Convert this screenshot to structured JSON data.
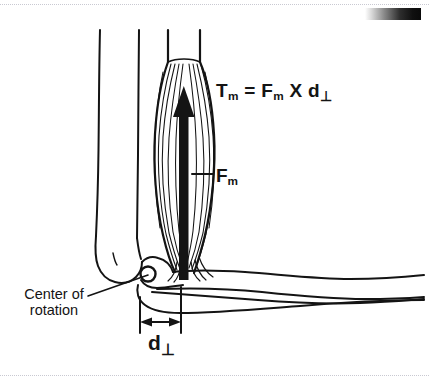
{
  "page": {
    "background_color": "#ffffff",
    "ink_color": "#141414",
    "width": 429,
    "height": 386
  },
  "decorations": {
    "top_rule": "dotted-separator",
    "bottom_rule": "dotted-separator",
    "gradient_bar": {
      "name": "grayscale-gradient-bar",
      "from_color": "#ffffff",
      "to_color": "#0a0a0a"
    }
  },
  "labels": {
    "equation": {
      "full_text": "Tm = Fm X d⊥",
      "torque_symbol": "T",
      "torque_subscript": "m",
      "equals": "=",
      "force_symbol": "F",
      "force_subscript": "m",
      "times": "X",
      "distance_symbol": "d",
      "distance_subscript": "⊥"
    },
    "force": {
      "symbol": "F",
      "subscript": "m"
    },
    "moment_arm": {
      "symbol": "d",
      "subscript": "⊥"
    },
    "center_of_rotation": {
      "line1": "Center of",
      "line2": "rotation"
    }
  },
  "figure": {
    "parts": [
      "humerus-bone",
      "upper-arm-outline",
      "biceps-muscle-belly",
      "muscle-fibers",
      "muscle-force-arrow",
      "elbow-joint-center-circle",
      "forearm-outline",
      "radius-ulna-outline",
      "moment-arm-dimension"
    ],
    "muscle_force_arrow": {
      "name": "muscle-force-vector-arrow",
      "direction": "up",
      "color": "#141414"
    },
    "moment_arm_dimension": {
      "name": "moment-arm-dimension-line",
      "style": "double-headed-arrow",
      "left_tick_x": 140,
      "right_tick_x": 181
    }
  }
}
